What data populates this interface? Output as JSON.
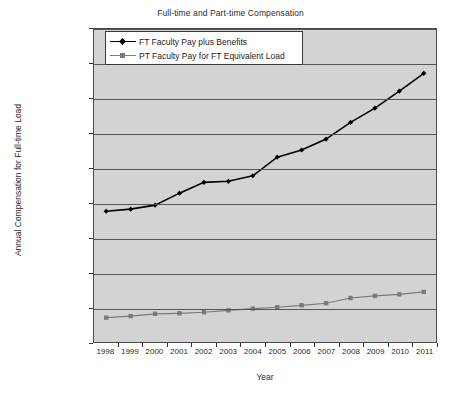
{
  "chart_data": {
    "type": "line",
    "title": "Full-time and Part-time Compensation",
    "xlabel": "Year",
    "ylabel": "Annual Compensation for Full-time Load",
    "categories": [
      1998,
      1999,
      2000,
      2001,
      2002,
      2003,
      2004,
      2005,
      2006,
      2007,
      2008,
      2009,
      2010,
      2011
    ],
    "xtick_labels": [
      "1998",
      "1999",
      "2000",
      "2001",
      "2002",
      "2003",
      "2004",
      "2005",
      "2006",
      "2007",
      "2008",
      "2009",
      "2010",
      "2011"
    ],
    "ylim": [
      0,
      180000
    ],
    "ytick_values": [
      0,
      20000,
      40000,
      60000,
      80000,
      100000,
      120000,
      140000,
      160000,
      180000
    ],
    "ytick_labels": [
      "$0.00",
      "$20,000.00",
      "$40,000.00",
      "$60,000.00",
      "$80,000.00",
      "$100,000.00",
      "$120,000.00",
      "$140,000.00",
      "$160,000.00",
      "$180,000.00"
    ],
    "grid": true,
    "legend_position": "top-left-inside",
    "plot_background": "#d3d3d3",
    "series": [
      {
        "name": "FT Faculty Pay plus Benefits",
        "color": "#000000",
        "marker": "diamond",
        "values": [
          75200,
          76400,
          78700,
          85600,
          91800,
          92400,
          95600,
          106300,
          110400,
          116700,
          126300,
          134500,
          144300,
          154500
        ]
      },
      {
        "name": "PT Faculty Pay for FT Equivalent Load",
        "color": "#7a7a7a",
        "marker": "square",
        "values": [
          14000,
          14900,
          16200,
          16500,
          17100,
          18200,
          19200,
          20000,
          21100,
          22300,
          25300,
          26500,
          27400,
          28800
        ]
      }
    ]
  }
}
